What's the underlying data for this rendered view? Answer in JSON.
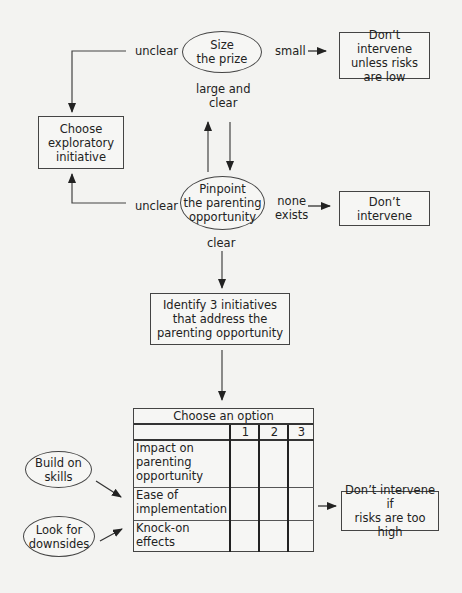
{
  "nodes": {
    "size_prize": "Size\nthe prize",
    "dont_intervene_low_risk": "Don’t intervene\nunless risks\nare low",
    "choose_exploratory": "Choose\nexploratory\ninitiative",
    "pinpoint": "Pinpoint\nthe parenting\nopportunity",
    "dont_intervene": "Don’t intervene",
    "identify_initiatives": "Identify 3 initiatives\nthat address the\nparenting opportunity",
    "build_on_skills": "Build on\nskills",
    "look_for_downsides": "Look for\ndownsides",
    "dont_intervene_high_risk": "Don’t intervene if\nrisks are too high"
  },
  "edge_labels": {
    "unclear_top": "unclear",
    "small": "small",
    "large_and_clear": "large and\nclear",
    "unclear_bottom": "unclear",
    "none_exists": "none\nexists",
    "clear": "clear"
  },
  "option_table": {
    "title": "Choose an option",
    "columns": [
      "1",
      "2",
      "3"
    ],
    "rows": [
      {
        "label": "Impact on\nparenting\nopportunity"
      },
      {
        "label": "Ease of\nimplementation"
      },
      {
        "label": "Knock-on\neffects"
      }
    ]
  },
  "colors": {
    "background": "#f3f3f1",
    "stroke": "#333333"
  }
}
